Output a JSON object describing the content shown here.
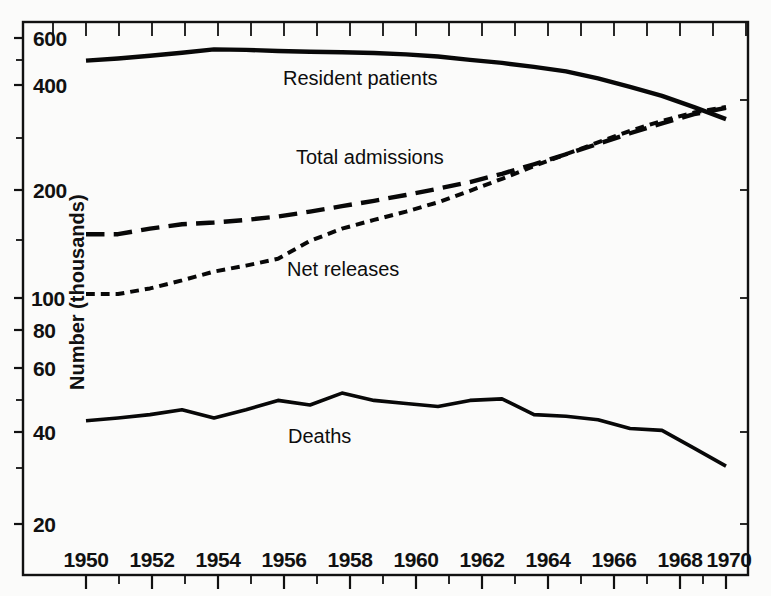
{
  "figure": {
    "background_color": "#fbfbfa",
    "ink_color": "#0d0d0d"
  },
  "axis": {
    "y_title": "Number (thousands)",
    "y_scale": "log",
    "y_tick_labels": [
      "600",
      "400",
      "200",
      "100",
      "80",
      "60",
      "40",
      "20"
    ],
    "y_tick_values": [
      600,
      400,
      200,
      100,
      80,
      60,
      40,
      20
    ],
    "y_minor_tick_values": [
      500,
      300,
      150,
      90,
      70,
      50,
      30,
      25
    ],
    "x_tick_labels": [
      "1950",
      "1952",
      "1954",
      "1956",
      "1958",
      "1960",
      "1962",
      "1964",
      "1966",
      "1968",
      "1970"
    ],
    "x_tick_values": [
      1950,
      1952,
      1954,
      1956,
      1958,
      1960,
      1962,
      1964,
      1966,
      1968,
      1970
    ],
    "x_minor_tick_values": [
      1951,
      1953,
      1955,
      1957,
      1959,
      1961,
      1963,
      1965,
      1967,
      1969
    ]
  },
  "series_labels": {
    "resident_patients": "Resident patients",
    "total_admissions": "Total admissions",
    "net_releases": "Net releases",
    "deaths": "Deaths"
  },
  "chart_data": {
    "type": "line",
    "title": "",
    "subtitle": "",
    "xlabel": "",
    "ylabel": "Number (thousands)",
    "yscale": "log",
    "ylim": [
      18,
      700
    ],
    "xlim": [
      1949.0,
      1970.7
    ],
    "grid": false,
    "legend": "inline-annotations",
    "x": [
      1950,
      1951,
      1952,
      1953,
      1954,
      1955,
      1956,
      1957,
      1958,
      1959,
      1960,
      1961,
      1962,
      1963,
      1964,
      1965,
      1966,
      1967,
      1968,
      1969,
      1970
    ],
    "series": [
      {
        "name": "Resident patients",
        "linestyle": "solid",
        "linewidth": 4.4,
        "values": [
          512,
          520,
          530,
          541,
          554,
          552,
          548,
          545,
          543,
          540,
          535,
          527,
          515,
          504,
          490,
          475,
          452,
          426,
          400,
          370,
          340
        ]
      },
      {
        "name": "Total admissions",
        "linestyle": "long-dash",
        "linewidth": 4.4,
        "values": [
          152,
          152,
          158,
          163,
          165,
          168,
          172,
          178,
          185,
          192,
          200,
          209,
          219,
          232,
          248,
          266,
          286,
          308,
          330,
          352,
          368
        ]
      },
      {
        "name": "Net releases",
        "linestyle": "short-dash",
        "linewidth": 4.0,
        "values": [
          100,
          100,
          104,
          110,
          117,
          122,
          128,
          145,
          158,
          168,
          178,
          190,
          206,
          224,
          245,
          266,
          289,
          313,
          336,
          356,
          370
        ]
      },
      {
        "name": "Deaths",
        "linestyle": "solid",
        "linewidth": 3.6,
        "values": [
          41.2,
          42.0,
          43.0,
          44.5,
          42.0,
          44.5,
          47.5,
          46.0,
          50.0,
          47.5,
          46.5,
          45.5,
          47.5,
          48.0,
          43.0,
          42.5,
          41.5,
          39.0,
          38.5,
          34.0,
          30.0
        ]
      }
    ]
  },
  "annotations": [
    {
      "id": "resident-patients-label",
      "text": "Resident patients",
      "x": 283,
      "y": 85
    },
    {
      "id": "total-admissions-label",
      "text": "Total admissions",
      "x": 296,
      "y": 164
    },
    {
      "id": "net-releases-label",
      "text": "Net releases",
      "x": 287,
      "y": 276
    },
    {
      "id": "deaths-label",
      "text": "Deaths",
      "x": 288,
      "y": 443
    }
  ]
}
